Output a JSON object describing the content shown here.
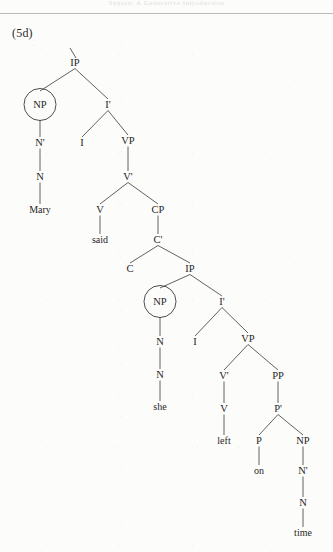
{
  "page": {
    "header_text": "Syntax: A Generative Introduction",
    "example_label": "(5d)",
    "background_color": "#fcfcfb",
    "ink_color": "#262626",
    "line_color": "#3a3a3a",
    "width": 333,
    "height": 552
  },
  "diagram": {
    "type": "syntax-tree",
    "sentence": "Mary said she left on time",
    "root_tick": true,
    "nodes": [
      {
        "id": "ip1",
        "label": "IP",
        "x": 75,
        "y": 66,
        "circled": false
      },
      {
        "id": "np1",
        "label": "NP",
        "x": 40,
        "y": 108,
        "circled": true
      },
      {
        "id": "ibar1",
        "label": "I'",
        "x": 108,
        "y": 108,
        "circled": false
      },
      {
        "id": "nbar1",
        "label": "N'",
        "x": 40,
        "y": 146,
        "circled": false
      },
      {
        "id": "i1",
        "label": "I",
        "x": 82,
        "y": 146,
        "circled": false
      },
      {
        "id": "vp1",
        "label": "VP",
        "x": 128,
        "y": 144,
        "circled": false
      },
      {
        "id": "n1",
        "label": "N",
        "x": 40,
        "y": 180,
        "circled": false
      },
      {
        "id": "vbar1",
        "label": "V'",
        "x": 128,
        "y": 180,
        "circled": false
      },
      {
        "id": "mary",
        "label": "Mary",
        "x": 40,
        "y": 213,
        "circled": false,
        "leaf": true
      },
      {
        "id": "v1",
        "label": "V",
        "x": 100,
        "y": 213,
        "circled": false
      },
      {
        "id": "cp1",
        "label": "CP",
        "x": 158,
        "y": 213,
        "circled": false
      },
      {
        "id": "said",
        "label": "said",
        "x": 100,
        "y": 243,
        "circled": false,
        "leaf": true
      },
      {
        "id": "cbar1",
        "label": "C'",
        "x": 158,
        "y": 243,
        "circled": false
      },
      {
        "id": "c1",
        "label": "C",
        "x": 130,
        "y": 272,
        "circled": false
      },
      {
        "id": "ip2",
        "label": "IP",
        "x": 190,
        "y": 272,
        "circled": false
      },
      {
        "id": "np2",
        "label": "NP",
        "x": 160,
        "y": 305,
        "circled": true
      },
      {
        "id": "ibar2",
        "label": "I'",
        "x": 222,
        "y": 305,
        "circled": false
      },
      {
        "id": "nbar2",
        "label": "N",
        "x": 160,
        "y": 345,
        "circled": false
      },
      {
        "id": "i2",
        "label": "I",
        "x": 195,
        "y": 345,
        "circled": false
      },
      {
        "id": "vp2",
        "label": "VP",
        "x": 248,
        "y": 342,
        "circled": false
      },
      {
        "id": "n2",
        "label": "N",
        "x": 160,
        "y": 378,
        "circled": false
      },
      {
        "id": "vbar2",
        "label": "V'",
        "x": 224,
        "y": 379,
        "circled": false
      },
      {
        "id": "pp1",
        "label": "PP",
        "x": 278,
        "y": 379,
        "circled": false
      },
      {
        "id": "she",
        "label": "she",
        "x": 160,
        "y": 410,
        "circled": false,
        "leaf": true
      },
      {
        "id": "v2",
        "label": "V",
        "x": 224,
        "y": 412,
        "circled": false
      },
      {
        "id": "pbar1",
        "label": "P'",
        "x": 278,
        "y": 412,
        "circled": false
      },
      {
        "id": "left",
        "label": "left",
        "x": 224,
        "y": 444,
        "circled": false,
        "leaf": true
      },
      {
        "id": "p1",
        "label": "P",
        "x": 259,
        "y": 444,
        "circled": false
      },
      {
        "id": "np3",
        "label": "NP",
        "x": 303,
        "y": 444,
        "circled": false
      },
      {
        "id": "on",
        "label": "on",
        "x": 259,
        "y": 474,
        "circled": false,
        "leaf": true
      },
      {
        "id": "nbar3",
        "label": "N'",
        "x": 303,
        "y": 474,
        "circled": false
      },
      {
        "id": "n3",
        "label": "N",
        "x": 303,
        "y": 506,
        "circled": false
      },
      {
        "id": "time",
        "label": "time",
        "x": 303,
        "y": 536,
        "circled": false,
        "leaf": true
      }
    ],
    "edges": [
      [
        "ip1",
        "np1"
      ],
      [
        "ip1",
        "ibar1"
      ],
      [
        "np1",
        "nbar1"
      ],
      [
        "nbar1",
        "n1"
      ],
      [
        "n1",
        "mary"
      ],
      [
        "ibar1",
        "i1"
      ],
      [
        "ibar1",
        "vp1"
      ],
      [
        "vp1",
        "vbar1"
      ],
      [
        "vbar1",
        "v1"
      ],
      [
        "vbar1",
        "cp1"
      ],
      [
        "v1",
        "said"
      ],
      [
        "cp1",
        "cbar1"
      ],
      [
        "cbar1",
        "c1"
      ],
      [
        "cbar1",
        "ip2"
      ],
      [
        "ip2",
        "np2"
      ],
      [
        "ip2",
        "ibar2"
      ],
      [
        "np2",
        "nbar2"
      ],
      [
        "nbar2",
        "n2"
      ],
      [
        "n2",
        "she"
      ],
      [
        "ibar2",
        "i2"
      ],
      [
        "ibar2",
        "vp2"
      ],
      [
        "vp2",
        "vbar2"
      ],
      [
        "vp2",
        "pp1"
      ],
      [
        "vbar2",
        "v2"
      ],
      [
        "v2",
        "left"
      ],
      [
        "pp1",
        "pbar1"
      ],
      [
        "pbar1",
        "p1"
      ],
      [
        "pbar1",
        "np3"
      ],
      [
        "p1",
        "on"
      ],
      [
        "np3",
        "nbar3"
      ],
      [
        "nbar3",
        "n3"
      ],
      [
        "n3",
        "time"
      ]
    ],
    "circled_node_ids": [
      "np1",
      "np2"
    ],
    "circle_radius": 16
  }
}
